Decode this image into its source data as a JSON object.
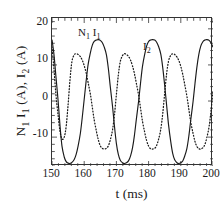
{
  "axes": {
    "xlabel": "t (ms)",
    "ylabel_parts": {
      "pre": "N",
      "sub1": "1",
      "mid": " I",
      "sub2": "1",
      "unit1": " (A), I",
      "sub3": "2",
      "unit2": " (A)"
    },
    "ylabel_text": "N1 I1 (A), I2 (A)",
    "yticks": [
      "20",
      "10",
      "0",
      "-10"
    ],
    "xticks": [
      "150",
      "160",
      "170",
      "180",
      "190",
      "200"
    ]
  },
  "annotations": {
    "series1_label": "N1 I1",
    "series1_label_parts": {
      "n": "N",
      "n_sub": "1",
      "i": "I",
      "i_sub": "1"
    },
    "series2_label": "I2",
    "series2_label_parts": {
      "i": "I",
      "i_sub": "2"
    }
  },
  "colors": {
    "axis": "#333333",
    "series1": "#1a1a1a",
    "series2": "#1a1a1a",
    "background": "#ffffff"
  },
  "chart_data": {
    "type": "line",
    "title": "",
    "subtitle": "",
    "xlabel": "t (ms)",
    "ylabel": "N1 I1 (A), I2 (A)",
    "xlim": [
      150,
      200
    ],
    "ylim": [
      -18.0,
      23.0
    ],
    "xticks": [
      150,
      160,
      170,
      180,
      190,
      200
    ],
    "yticks": [
      20,
      10,
      0,
      -10
    ],
    "xminor_interval": 2,
    "yminor_interval": 2,
    "grid": false,
    "legend": "none (inline annotations)",
    "annotations": [
      {
        "text": "N1 I1",
        "x": 158.5,
        "y": 19.5,
        "series": "N1 I1"
      },
      {
        "text": "I2",
        "x": 179.0,
        "y": 15.5,
        "series": "I2"
      }
    ],
    "series": [
      {
        "name": "N1 I1",
        "style": "solid",
        "color": "#1a1a1a",
        "period_ms": 20.0,
        "amplitude_A": 17.0,
        "x": [
          150.0,
          150.6,
          151.2,
          151.9,
          152.5,
          153.1,
          153.8,
          154.4,
          155.0,
          155.6,
          156.2,
          156.9,
          157.5,
          158.1,
          158.8,
          159.4,
          160.0,
          160.6,
          161.2,
          161.9,
          162.5,
          163.1,
          163.8,
          164.4,
          165.0,
          165.6,
          166.2,
          166.9,
          167.5,
          168.1,
          168.8,
          169.4,
          170.0,
          170.6,
          171.2,
          171.9,
          172.5,
          173.1,
          173.8,
          174.4,
          175.0,
          175.6,
          176.2,
          176.9,
          177.5,
          178.1,
          178.8,
          179.4,
          180.0,
          180.6,
          181.2,
          181.9,
          182.5,
          183.1,
          183.8,
          184.4,
          185.0,
          185.6,
          186.2,
          186.9,
          187.5,
          188.1,
          188.8,
          189.4,
          190.0,
          190.6,
          191.2,
          191.9,
          192.5,
          193.1,
          193.8,
          194.4,
          195.0,
          195.6,
          196.2,
          196.9,
          197.5,
          198.1,
          198.8,
          199.4,
          200.0
        ],
        "y": [
          17.0,
          13.0,
          7.0,
          0.0,
          -7.0,
          -12.5,
          -15.5,
          -16.8,
          -17.2,
          -17.3,
          -17.0,
          -16.2,
          -14.8,
          -12.5,
          -9.0,
          -4.5,
          0.5,
          5.5,
          10.0,
          13.3,
          15.4,
          16.5,
          16.9,
          17.0,
          16.8,
          16.2,
          15.0,
          12.8,
          9.0,
          4.0,
          -1.5,
          -7.0,
          -11.8,
          -14.8,
          -16.4,
          -17.1,
          -17.3,
          -17.1,
          -16.5,
          -15.2,
          -13.0,
          -9.5,
          -5.0,
          0.0,
          5.0,
          9.6,
          13.0,
          15.3,
          16.5,
          16.9,
          17.0,
          16.9,
          16.3,
          15.1,
          12.9,
          9.2,
          4.3,
          -1.2,
          -6.6,
          -11.4,
          -14.6,
          -16.3,
          -17.1,
          -17.3,
          -17.1,
          -16.6,
          -15.3,
          -13.1,
          -9.7,
          -5.2,
          -0.2,
          4.8,
          9.4,
          12.9,
          15.2,
          16.5,
          16.9,
          17.0,
          16.8,
          16.1,
          14.9
        ]
      },
      {
        "name": "I2",
        "style": "dotted",
        "color": "#1a1a1a",
        "period_ms": 20.0,
        "amplitude_A": 13.0,
        "phase_shift_ms": -6.5,
        "x": [
          150.0,
          150.6,
          151.2,
          151.9,
          152.5,
          153.1,
          153.8,
          154.4,
          155.0,
          155.6,
          156.2,
          156.9,
          157.5,
          158.1,
          158.8,
          159.4,
          160.0,
          160.6,
          161.2,
          161.9,
          162.5,
          163.1,
          163.8,
          164.4,
          165.0,
          165.6,
          166.2,
          166.9,
          167.5,
          168.1,
          168.8,
          169.4,
          170.0,
          170.6,
          171.2,
          171.9,
          172.5,
          173.1,
          173.8,
          174.4,
          175.0,
          175.6,
          176.2,
          176.9,
          177.5,
          178.1,
          178.8,
          179.4,
          180.0,
          180.6,
          181.2,
          181.9,
          182.5,
          183.1,
          183.8,
          184.4,
          185.0,
          185.6,
          186.2,
          186.9,
          187.5,
          188.1,
          188.8,
          189.4,
          190.0,
          190.6,
          191.2,
          191.9,
          192.5,
          193.1,
          193.8,
          194.4,
          195.0,
          195.6,
          196.2,
          196.9,
          197.5,
          198.1,
          198.8,
          199.4,
          200.0
        ],
        "y": [
          15.0,
          9.0,
          2.0,
          -4.0,
          -8.5,
          -10.5,
          -10.0,
          -7.0,
          -1.0,
          6.0,
          11.0,
          12.8,
          13.1,
          12.9,
          12.3,
          11.3,
          9.8,
          7.8,
          5.2,
          2.0,
          -1.6,
          -5.2,
          -8.4,
          -10.8,
          -12.4,
          -13.1,
          -13.3,
          -13.1,
          -12.4,
          -10.8,
          -8.0,
          -3.8,
          1.8,
          7.2,
          10.9,
          12.6,
          13.1,
          12.9,
          12.3,
          11.3,
          9.7,
          7.6,
          4.9,
          1.6,
          -2.0,
          -5.6,
          -8.7,
          -11.0,
          -12.5,
          -13.2,
          -13.3,
          -13.1,
          -12.3,
          -10.6,
          -7.7,
          -3.4,
          2.2,
          7.6,
          11.1,
          12.7,
          13.1,
          12.9,
          12.2,
          11.2,
          9.6,
          7.4,
          4.7,
          1.3,
          -2.3,
          -5.9,
          -8.9,
          -11.2,
          -12.6,
          -13.2,
          -13.3,
          -12.9,
          -12.0,
          -10.1,
          -7.0,
          -2.6,
          3.0
        ]
      }
    ]
  }
}
